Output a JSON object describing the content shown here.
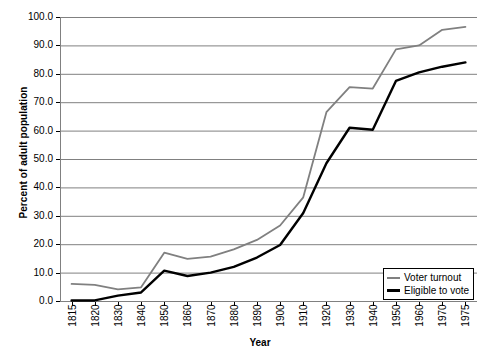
{
  "chart_data": {
    "type": "line",
    "title": "",
    "xlabel": "Year",
    "ylabel": "Percent of adult population",
    "categories": [
      "1815",
      "1820",
      "1830",
      "1840",
      "1850",
      "1860",
      "1870",
      "1880",
      "1890",
      "1900",
      "1910",
      "1920",
      "1930",
      "1940",
      "1950",
      "1960",
      "1970",
      "1975"
    ],
    "ylim": [
      0,
      100
    ],
    "ytick_labels": [
      "100.0",
      "90.0",
      "80.0",
      "70.0",
      "60.0",
      "50.0",
      "40.0",
      "30.0",
      "20.0",
      "10.0",
      "0.0"
    ],
    "ytick_values": [
      100,
      90,
      80,
      70,
      60,
      50,
      40,
      30,
      20,
      10,
      0
    ],
    "grid": true,
    "legend_position": "bottom-right",
    "series": [
      {
        "name": "Voter turnout",
        "color": "#808080",
        "values": [
          6.0,
          5.7,
          4.1,
          4.8,
          17.0,
          14.8,
          15.6,
          18.2,
          21.5,
          26.6,
          36.5,
          66.5,
          75.3,
          74.8,
          88.6,
          90.0,
          95.5,
          96.5
        ]
      },
      {
        "name": "Eligible to vote",
        "color": "#000000",
        "values": [
          0.2,
          0.2,
          1.9,
          3.0,
          10.7,
          8.8,
          10.0,
          12.0,
          15.3,
          19.7,
          31.0,
          48.5,
          61.0,
          60.3,
          77.5,
          80.5,
          82.5,
          84.0
        ]
      }
    ]
  },
  "legend": {
    "items": [
      {
        "label": "Voter turnout",
        "swatch": "gray-line-swatch"
      },
      {
        "label": "Eligible to vote",
        "swatch": "black-line-swatch"
      }
    ]
  },
  "axes": {
    "y_title": "Percent of adult population",
    "x_title": "Year"
  },
  "colors": {
    "turnout_line": "#808080",
    "eligible_line": "#000000",
    "gridline": "#808080",
    "axis": "#000000",
    "background": "#ffffff"
  }
}
